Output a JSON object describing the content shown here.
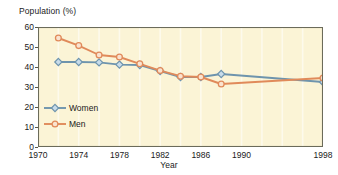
{
  "chart_data": {
    "type": "line",
    "title": "",
    "ylabel": "Population (%)",
    "xlabel": "Year",
    "x": [
      1972,
      1974,
      1976,
      1978,
      1980,
      1982,
      1984,
      1986,
      1988,
      1998
    ],
    "xlim": [
      1970,
      1998
    ],
    "ylim": [
      0,
      60
    ],
    "yticks": [
      0,
      10,
      20,
      30,
      40,
      50,
      60
    ],
    "xticks": [
      1970,
      1974,
      1978,
      1982,
      1986,
      1990,
      1998
    ],
    "xtick_labels": [
      "1970",
      "1974",
      "1978",
      "1982",
      "1986",
      "1990",
      "1998"
    ],
    "ytick_labels": [
      "0",
      "10",
      "20",
      "30",
      "40",
      "50",
      "60"
    ],
    "grid": "vertical",
    "grid_interval": 2,
    "legend_position": "inside-lower-left",
    "series": [
      {
        "name": "Women",
        "color": "#6e94ad",
        "marker": "diamond",
        "marker_fill": "#c8dcea",
        "values": [
          42.5,
          42.5,
          42.3,
          41.2,
          41.0,
          38.0,
          35.0,
          35.0,
          36.5,
          32.5
        ]
      },
      {
        "name": "Men",
        "color": "#e08a5a",
        "marker": "circle",
        "marker_fill": "#fae3cf",
        "values": [
          54.5,
          50.7,
          46.0,
          45.0,
          41.6,
          38.2,
          35.4,
          35.0,
          31.5,
          34.5
        ]
      }
    ],
    "plot_background": "#fbf4d6",
    "grid_color": "#fdfaec",
    "border_color": "#6b6b5a"
  },
  "legend": {
    "items": [
      {
        "label": "Women"
      },
      {
        "label": "Men"
      }
    ]
  },
  "axes": {
    "y_title": "Population (%)",
    "x_title": "Year"
  }
}
